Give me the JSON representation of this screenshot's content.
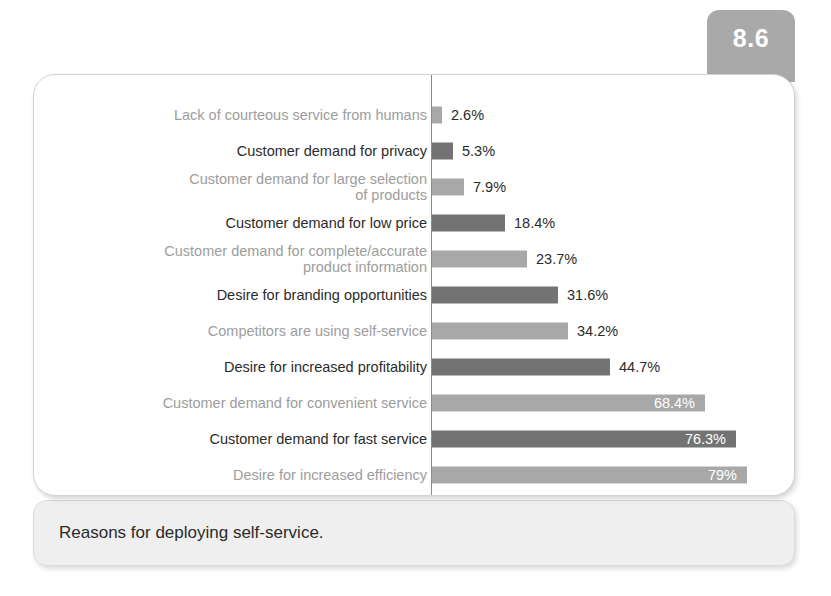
{
  "figure": {
    "number": "8.6",
    "caption": "Reasons for deploying self-service."
  },
  "chart_data": {
    "type": "bar",
    "orientation": "horizontal",
    "title": "Reasons for deploying self-service.",
    "xlabel": "",
    "ylabel": "",
    "xlim": [
      0,
      79
    ],
    "grid": false,
    "legend": "none",
    "axis_line": "vertical category axis at left of bars",
    "categories": [
      "Lack of courteous service from humans",
      "Customer demand for privacy",
      "Customer demand for large selection\nof products",
      "Customer demand for low price",
      "Customer demand for complete/accurate\nproduct information",
      "Desire for branding opportunities",
      "Competitors are using self-service",
      "Desire for increased profitability",
      "Customer demand for convenient service",
      "Customer demand for fast service",
      "Desire for increased efficiency"
    ],
    "values": [
      2.6,
      5.3,
      7.9,
      18.4,
      23.7,
      31.6,
      34.2,
      44.7,
      68.4,
      76.3,
      79
    ],
    "value_labels": [
      "2.6%",
      "5.3%",
      "7.9%",
      "18.4%",
      "23.7%",
      "31.6%",
      "34.2%",
      "44.7%",
      "68.4%",
      "76.3%",
      "79%"
    ],
    "label_placement": [
      "outside",
      "outside",
      "outside",
      "outside",
      "outside",
      "outside",
      "outside",
      "outside",
      "inside",
      "inside",
      "inside"
    ],
    "bar_shades": [
      "light",
      "dark",
      "light",
      "dark",
      "light",
      "dark",
      "light",
      "dark",
      "light",
      "dark",
      "light"
    ]
  },
  "colors": {
    "bar_light": "#a8a8a8",
    "bar_dark": "#737373",
    "label_light": "#9d9d9d",
    "label_dark": "#2b2b2b",
    "tab_background": "#a9a9a9",
    "caption_background": "#efefef",
    "card_background": "#ffffff",
    "axis": "#8c8c8c"
  }
}
